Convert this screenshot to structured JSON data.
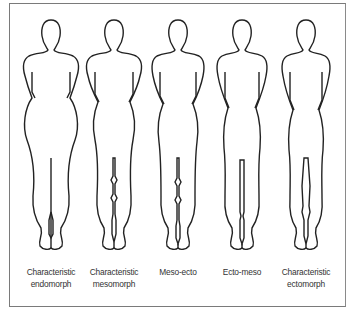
{
  "diagram": {
    "title": "",
    "figures": [
      {
        "id": "endomorph",
        "label_line1": "Characteristic",
        "label_line2": "endomorph",
        "leg_gap": "closed"
      },
      {
        "id": "mesomorph",
        "label_line1": "Characteristic",
        "label_line2": "mesomorph",
        "leg_gap": "diamonds"
      },
      {
        "id": "meso-ecto",
        "label_line1": "Meso-ecto",
        "label_line2": "",
        "leg_gap": "diamonds"
      },
      {
        "id": "ecto-meso",
        "label_line1": "Ecto-meso",
        "label_line2": "",
        "leg_gap": "narrow-open"
      },
      {
        "id": "ectomorph",
        "label_line1": "Characteristic",
        "label_line2": "ectomorph",
        "leg_gap": "open"
      }
    ],
    "colors": {
      "outline": "#222222",
      "frame": "#7a7a7a",
      "background": "#ffffff",
      "text": "#333333"
    }
  }
}
